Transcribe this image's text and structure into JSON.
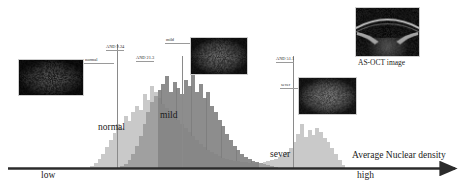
{
  "figure": {
    "axis": {
      "label": "Average Nuclear density",
      "low_label": "low",
      "high_label": "high",
      "color": "#2b2b2b"
    },
    "thresholds": [
      {
        "id": "thr-normal-mild",
        "label": "AND 9.24",
        "x_pct": 0.243
      },
      {
        "id": "thr-mild-sever",
        "label": "AND 21.3",
        "x_pct": 0.3885
      },
      {
        "id": "thr-sever-high",
        "label": "AND 51.1",
        "x_pct": 0.6375
      }
    ],
    "group_labels": [
      {
        "id": "group-normal",
        "text": "normal",
        "x_pct": 0.2175,
        "y_pct": 0.658
      },
      {
        "id": "group-mild",
        "text": "mild",
        "x_pct": 0.356,
        "y_pct": 0.593
      },
      {
        "id": "group-sever",
        "text": "sever",
        "x_pct": 0.582,
        "y_pct": 0.801
      }
    ],
    "thumbnails": [
      {
        "id": "thumb-normal",
        "tag": "normal",
        "x": 18,
        "y": 59,
        "w": 66,
        "h": 37,
        "kind": "dark-noise",
        "brightness": 0.055
      },
      {
        "id": "thumb-mild",
        "tag": "mild",
        "x": 190,
        "y": 37,
        "w": 58,
        "h": 38,
        "kind": "dark-noise",
        "brightness": 0.105
      },
      {
        "id": "thumb-sever",
        "tag": "sever",
        "x": 298,
        "y": 77,
        "w": 59,
        "h": 38,
        "kind": "dark-noise",
        "brightness": 0.15
      },
      {
        "id": "thumb-asoct",
        "tag": "",
        "x": 355,
        "y": 7,
        "w": 65,
        "h": 50,
        "kind": "asoct",
        "brightness": 0.2
      }
    ],
    "asoct_caption": "AS-OCT image",
    "colors": {
      "normal_bars": "#c9c9c9",
      "mild_bars": "#9a9a9a",
      "overlap_bars": "#7d7d7d",
      "line": "#8a8a8a",
      "axis": "#2b2b2b",
      "text": "#1a1a1a"
    }
  },
  "chart_data": {
    "type": "bar",
    "title": "",
    "xlabel": "Average Nuclear density",
    "ylabel": "",
    "grid": false,
    "legend": [
      "normal",
      "mild",
      "sever"
    ],
    "x_axis_endpoints": [
      "low",
      "high"
    ],
    "bin_count": 72,
    "plot_left_px": 75,
    "plot_right_px": 345,
    "baseline_px": 168,
    "max_height_px": 100,
    "series": [
      {
        "name": "normal",
        "color": "#c9c9c9",
        "values": [
          0,
          0,
          0,
          0,
          2,
          5,
          9,
          14,
          21,
          28,
          35,
          44,
          40,
          52,
          47,
          56,
          62,
          58,
          74,
          68,
          82,
          76,
          70,
          64,
          60,
          56,
          52,
          48,
          44,
          40,
          36,
          32,
          28,
          24,
          21,
          18,
          16,
          14,
          12,
          10,
          9,
          8,
          7,
          7,
          6,
          6,
          5,
          5,
          5,
          5,
          6,
          7,
          8,
          9,
          11,
          13,
          16,
          20,
          26,
          34,
          44,
          31,
          38,
          33,
          40,
          36,
          30,
          26,
          20,
          14,
          8,
          3
        ]
      },
      {
        "name": "mild",
        "color": "#9a9a9a",
        "values": [
          0,
          0,
          0,
          0,
          0,
          0,
          0,
          0,
          0,
          0,
          0,
          0,
          2,
          4,
          8,
          14,
          22,
          32,
          44,
          56,
          66,
          72,
          78,
          84,
          92,
          76,
          86,
          80,
          74,
          88,
          82,
          94,
          76,
          84,
          70,
          76,
          62,
          56,
          48,
          42,
          34,
          28,
          22,
          18,
          14,
          11,
          9,
          7,
          6,
          5,
          4,
          3,
          2,
          1,
          0,
          0,
          0,
          0,
          0,
          0,
          0,
          0,
          0,
          0,
          0,
          0,
          0,
          0,
          0,
          0,
          0,
          0
        ]
      },
      {
        "name": "sever",
        "color": "#c9c9c9",
        "values": [
          0,
          0,
          0,
          0,
          0,
          0,
          0,
          0,
          0,
          0,
          0,
          0,
          0,
          0,
          0,
          0,
          0,
          0,
          0,
          0,
          0,
          0,
          0,
          0,
          0,
          0,
          0,
          0,
          0,
          0,
          0,
          0,
          0,
          0,
          0,
          0,
          0,
          0,
          0,
          0,
          0,
          0,
          0,
          0,
          0,
          0,
          0,
          0,
          0,
          0,
          0,
          0,
          0,
          0,
          0,
          0,
          0,
          0,
          0,
          0,
          0,
          0,
          0,
          0,
          0,
          0,
          0,
          0,
          0,
          0,
          0,
          0
        ]
      }
    ]
  }
}
